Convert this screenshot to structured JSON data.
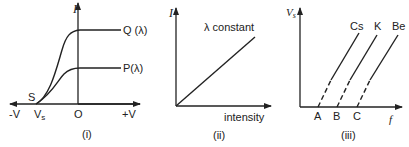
{
  "panels": [
    {
      "id": "i",
      "caption": "(i)",
      "y_axis_label": "I",
      "x_neg_label": "-V",
      "x_pos_label": "+V",
      "origin_label": "O",
      "stopping_label": "V",
      "stopping_sub": "s",
      "point_label": "S",
      "curves": [
        {
          "label": "Q (λ)"
        },
        {
          "label": "P(λ)"
        }
      ]
    },
    {
      "id": "ii",
      "caption": "(ii)",
      "y_axis_label": "I",
      "x_axis_label": "intensity",
      "line_label": "λ constant"
    },
    {
      "id": "iii",
      "caption": "(iii)",
      "y_axis_label": "V",
      "y_axis_sub": "s",
      "x_axis_label": "f",
      "lines": [
        {
          "label": "Cs",
          "intercept": "A"
        },
        {
          "label": "K",
          "intercept": "B"
        },
        {
          "label": "Be",
          "intercept": "C"
        }
      ]
    }
  ]
}
